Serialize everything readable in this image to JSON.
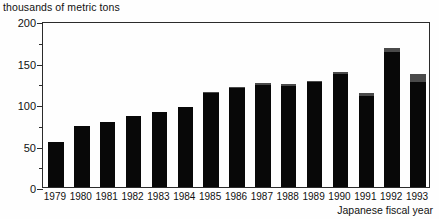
{
  "chart_data": {
    "type": "bar",
    "title": "",
    "ylabel": "thousands of metric tons",
    "xlabel": "Japanese fiscal year",
    "ylim": [
      0,
      200
    ],
    "yticks": [
      0,
      50,
      100,
      150,
      200
    ],
    "ytick_labels": [
      "0",
      "50",
      "100",
      "150",
      "200"
    ],
    "yticks_minor": [
      25,
      75,
      125,
      175
    ],
    "grid": false,
    "stacked": true,
    "legend_position": "top-left-inside",
    "categories": [
      "1979",
      "1980",
      "1981",
      "1982",
      "1983",
      "1984",
      "1985",
      "1986",
      "1987",
      "1988",
      "1989",
      "1990",
      "1991",
      "1992",
      "1993"
    ],
    "series": [
      {
        "name": "United States",
        "color": "#080808",
        "values": [
          54,
          73,
          78,
          86,
          90,
          96,
          113,
          119,
          123,
          122,
          126,
          136,
          110,
          163,
          127
        ]
      },
      {
        "name": "Others",
        "color": "#4a4a4a",
        "values": [
          0,
          0,
          0,
          0,
          0,
          0,
          2,
          2,
          2,
          2,
          2,
          3,
          3,
          5,
          9
        ]
      }
    ],
    "totals": [
      54,
      73,
      78,
      86,
      90,
      96,
      115,
      121,
      125,
      124,
      128,
      139,
      113,
      168,
      136
    ]
  },
  "colors": {
    "united_states": "#080808",
    "others": "#4a4a4a",
    "axis": "#2b2b2b",
    "background": "#fefefe"
  }
}
